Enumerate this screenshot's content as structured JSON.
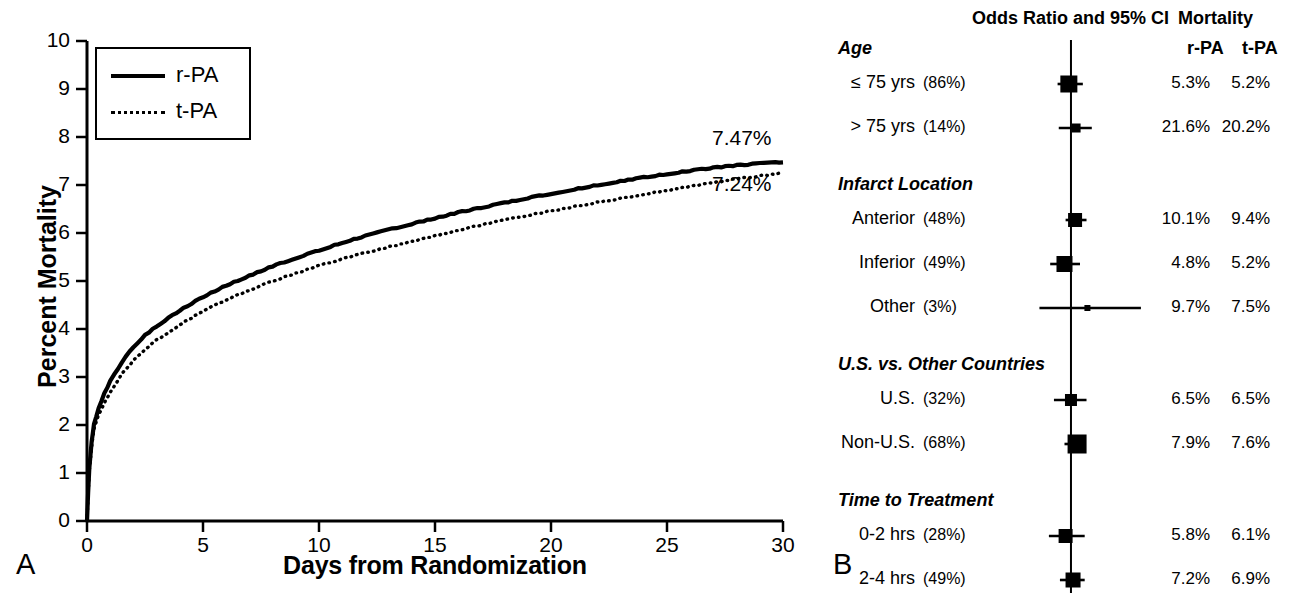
{
  "figure": {
    "panel_a_letter": "A",
    "panel_b_letter": "B"
  },
  "chart_data": [
    {
      "id": "panel_a",
      "type": "line",
      "title": "",
      "xlabel": "Days from Randomization",
      "ylabel": "Percent Mortality",
      "xlim": [
        0,
        30
      ],
      "ylim": [
        0,
        10
      ],
      "xticks": [
        "0",
        "5",
        "10",
        "15",
        "20",
        "25",
        "30"
      ],
      "yticks": [
        "0",
        "1",
        "2",
        "3",
        "4",
        "5",
        "6",
        "7",
        "8",
        "9",
        "10"
      ],
      "grid": false,
      "legend_position": "top-left",
      "legend": [
        {
          "label": "r-PA",
          "style": "solid"
        },
        {
          "label": "t-PA",
          "style": "dotted"
        }
      ],
      "annotations": [
        {
          "text": "7.47%",
          "series": "r-PA",
          "x": 30,
          "y": 7.47
        },
        {
          "text": "7.24%",
          "series": "t-PA",
          "x": 30,
          "y": 7.24
        }
      ],
      "series": [
        {
          "name": "r-PA",
          "style": "solid",
          "x": [
            0,
            0.05,
            0.1,
            0.2,
            0.3,
            0.5,
            0.75,
            1,
            1.5,
            2,
            2.5,
            3,
            4,
            5,
            6,
            7,
            8,
            9,
            10,
            11,
            12,
            13,
            14,
            15,
            16,
            17,
            18,
            19,
            20,
            21,
            22,
            23,
            24,
            25,
            26,
            27,
            28,
            29,
            30
          ],
          "y": [
            0,
            0.6,
            1.1,
            1.65,
            2.0,
            2.35,
            2.65,
            2.9,
            3.3,
            3.62,
            3.86,
            4.05,
            4.38,
            4.66,
            4.9,
            5.1,
            5.3,
            5.47,
            5.63,
            5.79,
            5.93,
            6.06,
            6.18,
            6.3,
            6.42,
            6.52,
            6.62,
            6.72,
            6.81,
            6.9,
            6.99,
            7.07,
            7.15,
            7.22,
            7.29,
            7.35,
            7.4,
            7.44,
            7.47
          ]
        },
        {
          "name": "t-PA",
          "style": "dotted",
          "x": [
            0,
            0.05,
            0.1,
            0.2,
            0.3,
            0.5,
            0.75,
            1,
            1.5,
            2,
            2.5,
            3,
            4,
            5,
            6,
            7,
            8,
            9,
            10,
            11,
            12,
            13,
            14,
            15,
            16,
            17,
            18,
            19,
            20,
            21,
            22,
            23,
            24,
            25,
            26,
            27,
            28,
            29,
            30
          ],
          "y": [
            0,
            0.55,
            1.05,
            1.55,
            1.9,
            2.2,
            2.45,
            2.68,
            3.05,
            3.33,
            3.57,
            3.76,
            4.08,
            4.36,
            4.6,
            4.8,
            4.99,
            5.15,
            5.31,
            5.45,
            5.58,
            5.7,
            5.81,
            5.93,
            6.05,
            6.16,
            6.26,
            6.36,
            6.45,
            6.54,
            6.63,
            6.71,
            6.8,
            6.88,
            6.96,
            7.04,
            7.12,
            7.18,
            7.24
          ]
        }
      ]
    },
    {
      "id": "panel_b",
      "type": "forest",
      "title": "Odds Ratio and 95% CI",
      "headers": {
        "odds_ratio": "Odds Ratio and 95% CI",
        "mortality": "Mortality",
        "col_rpa": "r-PA",
        "col_tpa": "t-PA"
      },
      "xlabel": "",
      "xscale": "log",
      "xlim": [
        0.4,
        2.7
      ],
      "xticks": [
        "0.4",
        "1.0",
        "2.7"
      ],
      "xtick_values": [
        0.4,
        1.0,
        2.7
      ],
      "minor_ticks": [
        0.5,
        0.6,
        0.7,
        0.8,
        0.9,
        2.0
      ],
      "reference_line": 1.0,
      "footnote_left": "r-PA Better",
      "footnote_right": "t-PA Better",
      "groups": [
        {
          "title": "Age",
          "rows": [
            {
              "label": "≤ 75 yrs",
              "pct": "(86%)",
              "or": 0.98,
              "ci_low": 0.88,
              "ci_high": 1.12,
              "box": 17,
              "rpa": "5.3%",
              "tpa": "5.2%"
            },
            {
              "label": "> 75 yrs",
              "pct": "(14%)",
              "or": 1.05,
              "ci_low": 0.89,
              "ci_high": 1.22,
              "box": 9,
              "rpa": "21.6%",
              "tpa": "20.2%"
            }
          ]
        },
        {
          "title": "Infarct Location",
          "rows": [
            {
              "label": "Anterior",
              "pct": "(48%)",
              "or": 1.04,
              "ci_low": 0.95,
              "ci_high": 1.16,
              "box": 14,
              "rpa": "10.1%",
              "tpa": "9.4%"
            },
            {
              "label": "Inferior",
              "pct": "(49%)",
              "or": 0.94,
              "ci_low": 0.82,
              "ci_high": 1.09,
              "box": 16,
              "rpa": "4.8%",
              "tpa": "5.2%"
            },
            {
              "label": "Other",
              "pct": "(3%)",
              "or": 1.17,
              "ci_low": 0.74,
              "ci_high": 1.95,
              "box": 6,
              "rpa": "9.7%",
              "tpa": "7.5%"
            }
          ]
        },
        {
          "title": "U.S. vs. Other Countries",
          "rows": [
            {
              "label": "U.S.",
              "pct": "(32%)",
              "or": 1.0,
              "ci_low": 0.85,
              "ci_high": 1.16,
              "box": 12,
              "rpa": "6.5%",
              "tpa": "6.5%"
            },
            {
              "label": "Non-U.S.",
              "pct": "(68%)",
              "or": 1.06,
              "ci_low": 0.94,
              "ci_high": 1.12,
              "box": 19,
              "rpa": "7.9%",
              "tpa": "7.6%"
            }
          ]
        },
        {
          "title": "Time to Treatment",
          "rows": [
            {
              "label": "0-2 hrs",
              "pct": "(28%)",
              "or": 0.95,
              "ci_low": 0.81,
              "ci_high": 1.14,
              "box": 14,
              "rpa": "5.8%",
              "tpa": "6.1%"
            },
            {
              "label": "2-4 hrs",
              "pct": "(49%)",
              "or": 1.02,
              "ci_low": 0.9,
              "ci_high": 1.14,
              "box": 15,
              "rpa": "7.2%",
              "tpa": "6.9%"
            },
            {
              "label": "> 4 hrs",
              "pct": "(23%)",
              "or": 1.12,
              "ci_low": 0.97,
              "ci_high": 1.27,
              "box": 12,
              "rpa": "9.7%",
              "tpa": "7.9%"
            }
          ]
        }
      ]
    }
  ]
}
